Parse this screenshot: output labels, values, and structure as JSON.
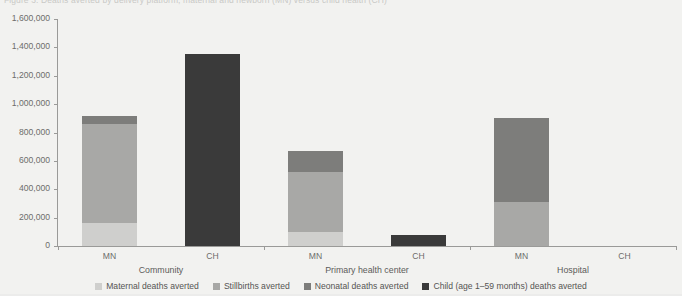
{
  "caption": {
    "text": "Figure 3. Deaths averted by delivery platform, maternal and newborn (MN) versus child health (CH)"
  },
  "chart_data": {
    "type": "bar",
    "subtype": "stacked-bar-grouped",
    "title": "",
    "xlabel": "",
    "ylabel": "",
    "ylim": [
      0,
      1600000
    ],
    "ytick_step": 200000,
    "ytick_labels": [
      "1,600,000",
      "1,400,000",
      "1,200,000",
      "1,000,000",
      "800,000",
      "600,000",
      "400,000",
      "200,000",
      "0"
    ],
    "ytick_values": [
      1600000,
      1400000,
      1200000,
      1000000,
      800000,
      600000,
      400000,
      200000,
      0
    ],
    "grid": false,
    "legend_position": "bottom",
    "groups": [
      "Community",
      "Primary health center",
      "Hospital"
    ],
    "bars": [
      "MN",
      "CH"
    ],
    "series": [
      {
        "name": "Maternal deaths averted",
        "color": "#cfcfcd",
        "values": [
          {
            "group": "Community",
            "bar": "MN",
            "value": 160000
          },
          {
            "group": "Community",
            "bar": "CH",
            "value": 0
          },
          {
            "group": "Primary health center",
            "bar": "MN",
            "value": 100000
          },
          {
            "group": "Primary health center",
            "bar": "CH",
            "value": 0
          },
          {
            "group": "Hospital",
            "bar": "MN",
            "value": 0
          },
          {
            "group": "Hospital",
            "bar": "CH",
            "value": 0
          }
        ]
      },
      {
        "name": "Stillbirths averted",
        "color": "#a8a8a6",
        "values": [
          {
            "group": "Community",
            "bar": "MN",
            "value": 700000
          },
          {
            "group": "Community",
            "bar": "CH",
            "value": 0
          },
          {
            "group": "Primary health center",
            "bar": "MN",
            "value": 420000
          },
          {
            "group": "Primary health center",
            "bar": "CH",
            "value": 0
          },
          {
            "group": "Hospital",
            "bar": "MN",
            "value": 310000
          },
          {
            "group": "Hospital",
            "bar": "CH",
            "value": 0
          }
        ]
      },
      {
        "name": "Neonatal deaths averted",
        "color": "#7d7d7b",
        "values": [
          {
            "group": "Community",
            "bar": "MN",
            "value": 55000
          },
          {
            "group": "Community",
            "bar": "CH",
            "value": 0
          },
          {
            "group": "Primary health center",
            "bar": "MN",
            "value": 150000
          },
          {
            "group": "Primary health center",
            "bar": "CH",
            "value": 0
          },
          {
            "group": "Hospital",
            "bar": "MN",
            "value": 590000
          },
          {
            "group": "Hospital",
            "bar": "CH",
            "value": 0
          }
        ]
      },
      {
        "name": "Child (age 1–59 months) deaths averted",
        "color": "#3a3a3a",
        "values": [
          {
            "group": "Community",
            "bar": "MN",
            "value": 0
          },
          {
            "group": "Community",
            "bar": "CH",
            "value": 1350000
          },
          {
            "group": "Primary health center",
            "bar": "MN",
            "value": 0
          },
          {
            "group": "Primary health center",
            "bar": "CH",
            "value": 80000
          },
          {
            "group": "Hospital",
            "bar": "MN",
            "value": 0
          },
          {
            "group": "Hospital",
            "bar": "CH",
            "value": 0
          }
        ]
      }
    ],
    "totals": [
      {
        "group": "Community",
        "bar": "MN",
        "total": 915000
      },
      {
        "group": "Community",
        "bar": "CH",
        "total": 1350000
      },
      {
        "group": "Primary health center",
        "bar": "MN",
        "total": 670000
      },
      {
        "group": "Primary health center",
        "bar": "CH",
        "total": 80000
      },
      {
        "group": "Hospital",
        "bar": "MN",
        "total": 900000
      },
      {
        "group": "Hospital",
        "bar": "CH",
        "total": 0
      }
    ]
  },
  "axis": {
    "y_ticks": [
      {
        "label": "1,600,000",
        "value": 1600000
      },
      {
        "label": "1,400,000",
        "value": 1400000
      },
      {
        "label": "1,200,000",
        "value": 1200000
      },
      {
        "label": "1,000,000",
        "value": 1000000
      },
      {
        "label": "800,000",
        "value": 800000
      },
      {
        "label": "600,000",
        "value": 600000
      },
      {
        "label": "400,000",
        "value": 400000
      },
      {
        "label": "200,000",
        "value": 200000
      },
      {
        "label": "0",
        "value": 0
      }
    ],
    "x_groups": [
      {
        "label": "Community",
        "bars": [
          {
            "label": "MN"
          },
          {
            "label": "CH"
          }
        ]
      },
      {
        "label": "Primary health center",
        "bars": [
          {
            "label": "MN"
          },
          {
            "label": "CH"
          }
        ]
      },
      {
        "label": "Hospital",
        "bars": [
          {
            "label": "MN"
          },
          {
            "label": "CH"
          }
        ]
      }
    ]
  },
  "legend": {
    "items": [
      {
        "label": "Maternal deaths averted",
        "color": "#cfcfcd"
      },
      {
        "label": "Stillbirths averted",
        "color": "#a8a8a6"
      },
      {
        "label": "Neonatal deaths averted",
        "color": "#7d7d7b"
      },
      {
        "label": "Child (age 1–59 months) deaths averted",
        "color": "#3a3a3a"
      }
    ]
  },
  "colors": {
    "background": "#f2f2f0",
    "axis": "#9a9a98",
    "text": "#6d6d6b"
  }
}
